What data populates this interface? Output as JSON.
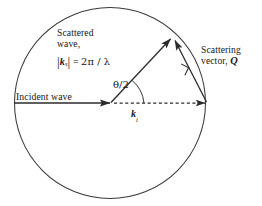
{
  "figure": {
    "background_color": "#ffffff",
    "stroke_color": "#2b2b2b",
    "text_color": "#161616"
  },
  "labels": {
    "scattered_wave": {
      "line1": "Scattered",
      "line2": "wave,"
    },
    "ks_magnitude": {
      "bar_open": "|",
      "symbol": "k",
      "subscript": "s",
      "bar_close": "|",
      "equals": "=",
      "value": "2π / λ",
      "full_text": "|ks| = 2π / λ"
    },
    "scattering_vector": {
      "line1": "Scattering",
      "line2_prefix": "vector, ",
      "line2_symbol": "Q",
      "full_text": "Scattering vector, Q"
    },
    "incident_wave": "Incident wave",
    "theta_half": "θ/2",
    "ki": {
      "symbol": "k",
      "subscript": "i",
      "full_text": "ki"
    }
  },
  "geometry": {
    "circle": {
      "center_x": 110,
      "center_y": 103,
      "radius": 95.5,
      "stroke_width": 1.1
    },
    "origin": {
      "x": 110,
      "y": 103
    },
    "incident_arrow": {
      "x1": 14,
      "y1": 103,
      "x2": 112,
      "y2": 103
    },
    "scattered_arrow": {
      "x1": 111,
      "y1": 102,
      "x2": 172,
      "y2": 37
    },
    "ki_dashed_arrow": {
      "x1": 113,
      "y1": 103,
      "x2": 207,
      "y2": 103
    },
    "q_arrow": {
      "x1": 207,
      "y1": 103,
      "x2": 174,
      "y2": 38
    },
    "angle_arc_radius": 34,
    "right_angle_marker": {
      "x": 186,
      "y": 66,
      "size": 9
    }
  }
}
